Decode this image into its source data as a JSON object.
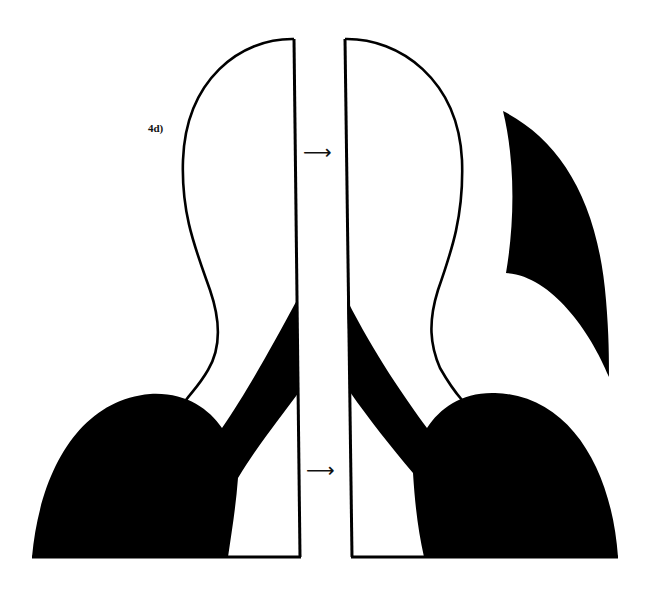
{
  "figure": {
    "panel_label": "4d)",
    "arrows": [
      {
        "glyph": "⟶",
        "position": "upper"
      },
      {
        "glyph": "⟶",
        "position": "lower"
      }
    ],
    "colors": {
      "ink": "#000000",
      "background": "#ffffff"
    },
    "shapes": [
      "left-half-outline",
      "left-black-shoulder",
      "right-half-outline",
      "right-black-shoulder",
      "detached-black-fin"
    ]
  }
}
